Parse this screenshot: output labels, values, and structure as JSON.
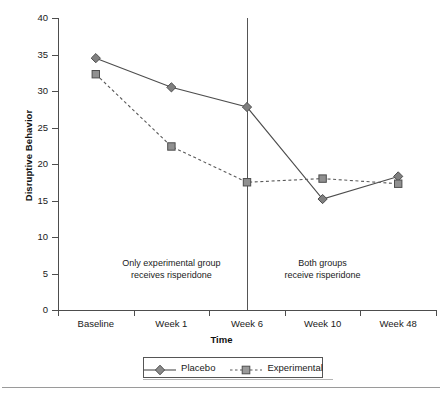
{
  "chart_data": {
    "type": "line",
    "title": "",
    "xlabel": "Time",
    "ylabel": "Disruptive Behavior",
    "categories": [
      "Baseline",
      "Week 1",
      "Week 6",
      "Week 10",
      "Week 48"
    ],
    "series": [
      {
        "name": "Placebo",
        "values": [
          34.5,
          30.5,
          27.8,
          15.2,
          18.3
        ],
        "line_style": "solid",
        "marker": "diamond",
        "color": "#808080",
        "line_color": "#4d4d4d"
      },
      {
        "name": "Experimental",
        "values": [
          32.3,
          22.4,
          17.5,
          18.0,
          17.3
        ],
        "line_style": "dashed",
        "marker": "square",
        "color": "#909090",
        "line_color": "#5a5a5a"
      }
    ],
    "ylim": [
      0,
      40
    ],
    "yticks": [
      0,
      5,
      10,
      15,
      20,
      25,
      30,
      35,
      40
    ],
    "ytick_labels": [
      "0",
      "5",
      "10",
      "15",
      "20",
      "25",
      "30",
      "35",
      "40"
    ],
    "grid": false,
    "legend_position": "bottom",
    "annotations": [
      {
        "id": "left-phase-note",
        "text": "Only experimental group\nreceives risperidone",
        "x_category_index": 1,
        "y_value": 5.6
      },
      {
        "id": "right-phase-note",
        "text": "Both groups\nreceive risperidone",
        "x_category_index": 3,
        "y_value": 5.6
      }
    ],
    "vline": {
      "id": "phase-divider",
      "x_category_index": 2,
      "label": ""
    }
  },
  "legend": {
    "entries": [
      {
        "label": "Placebo",
        "marker": "diamond-icon",
        "line": "solid"
      },
      {
        "label": "Experimental",
        "marker": "square-icon",
        "line": "dashed"
      }
    ]
  }
}
